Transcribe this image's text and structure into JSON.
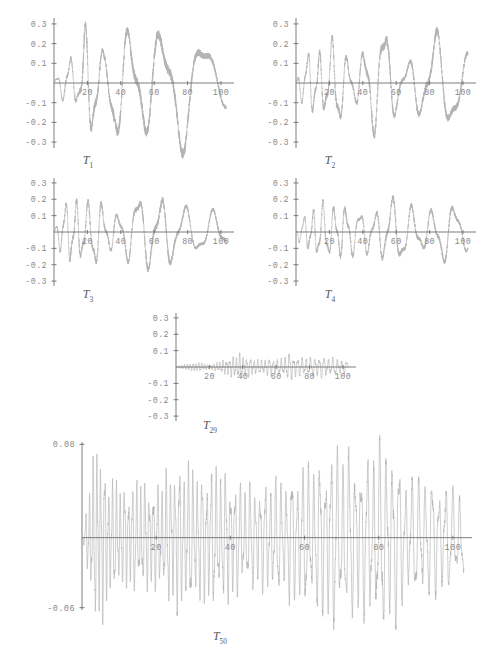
{
  "figure": {
    "background": "#ffffff",
    "curve_color": "#b3b3b3",
    "axis_color": "#6e6e6e",
    "label_color": "#8a8a8a"
  },
  "chart_data": [
    {
      "type": "line",
      "title": "T1",
      "label_base": "T",
      "label_sub": "1",
      "xlabel": "",
      "ylabel": "",
      "xlim": [
        0,
        103
      ],
      "ylim": [
        -0.33,
        0.33
      ],
      "xticks": [
        20,
        40,
        60,
        80,
        100
      ],
      "xtick_labels": [
        "20",
        "40",
        "60",
        "80",
        "100"
      ],
      "yticks": [
        0.3,
        0.2,
        0.1,
        -0.1,
        -0.2,
        -0.3
      ],
      "ytick_labels": [
        "0.3",
        "0.2",
        "0.1",
        "-0.1",
        "-0.2",
        "-0.3"
      ],
      "grid": false,
      "legend": "none",
      "description": "Slow amplitude-modulated oscillation; burst near t=20 reaching 0.33, smooth large lobes at t=50, 78",
      "envelope": [
        [
          0,
          0.02
        ],
        [
          10,
          0.13
        ],
        [
          14,
          0.1
        ],
        [
          18,
          0.34
        ],
        [
          24,
          0.3
        ],
        [
          30,
          0.12
        ],
        [
          36,
          0.28
        ],
        [
          44,
          0.28
        ],
        [
          52,
          0.3
        ],
        [
          62,
          0.31
        ],
        [
          70,
          0.3
        ],
        [
          78,
          0.32
        ],
        [
          88,
          0.22
        ],
        [
          96,
          0.15
        ],
        [
          103,
          0.12
        ]
      ],
      "carrier_period": [
        [
          0,
          7
        ],
        [
          20,
          10
        ],
        [
          40,
          16
        ],
        [
          60,
          22
        ],
        [
          80,
          26
        ],
        [
          103,
          28
        ]
      ],
      "phase": 0.2
    },
    {
      "type": "line",
      "title": "T2",
      "label_base": "T",
      "label_sub": "2",
      "xlim": [
        0,
        103
      ],
      "ylim": [
        -0.33,
        0.33
      ],
      "xticks": [
        20,
        40,
        60,
        80,
        100
      ],
      "xtick_labels": [
        "20",
        "40",
        "60",
        "80",
        "100"
      ],
      "yticks": [
        0.3,
        0.2,
        0.1,
        -0.1,
        -0.2,
        -0.3
      ],
      "ytick_labels": [
        "0.3",
        "0.2",
        "0.1",
        "-0.1",
        "-0.2",
        "-0.3"
      ],
      "grid": false,
      "legend": "none",
      "description": "Faster modulated oscillation, peak 0.24 near t=24 and t=84, deep trough -0.29 near t=54",
      "envelope": [
        [
          0,
          0.03
        ],
        [
          8,
          0.16
        ],
        [
          14,
          0.18
        ],
        [
          20,
          0.17
        ],
        [
          24,
          0.24
        ],
        [
          30,
          0.14
        ],
        [
          36,
          0.12
        ],
        [
          42,
          0.22
        ],
        [
          48,
          0.24
        ],
        [
          54,
          0.29
        ],
        [
          60,
          0.14
        ],
        [
          66,
          0.12
        ],
        [
          72,
          0.18
        ],
        [
          78,
          0.2
        ],
        [
          84,
          0.25
        ],
        [
          92,
          0.22
        ],
        [
          103,
          0.14
        ]
      ],
      "carrier_period": [
        [
          0,
          6
        ],
        [
          20,
          8
        ],
        [
          40,
          11
        ],
        [
          60,
          14
        ],
        [
          80,
          18
        ],
        [
          103,
          20
        ]
      ],
      "phase": 1.1
    },
    {
      "type": "line",
      "title": "T3",
      "label_base": "T",
      "label_sub": "3",
      "xlim": [
        0,
        103
      ],
      "ylim": [
        -0.33,
        0.33
      ],
      "xticks": [
        20,
        40,
        60,
        80,
        100
      ],
      "xtick_labels": [
        "20",
        "40",
        "60",
        "80",
        "100"
      ],
      "yticks": [
        0.3,
        0.2,
        0.1,
        -0.1,
        -0.2,
        -0.3
      ],
      "ytick_labels": [
        "0.3",
        "0.2",
        "0.1",
        "-0.1",
        "-0.2",
        "-0.3"
      ],
      "grid": false,
      "legend": "none",
      "description": "Dense early oscillations, growing lobes peaking 0.26 near t=66, decaying after t=80",
      "envelope": [
        [
          0,
          0.03
        ],
        [
          8,
          0.19
        ],
        [
          14,
          0.22
        ],
        [
          20,
          0.16
        ],
        [
          26,
          0.21
        ],
        [
          32,
          0.14
        ],
        [
          38,
          0.13
        ],
        [
          44,
          0.16
        ],
        [
          52,
          0.23
        ],
        [
          58,
          0.22
        ],
        [
          66,
          0.26
        ],
        [
          72,
          0.2
        ],
        [
          80,
          0.14
        ],
        [
          88,
          0.11
        ],
        [
          96,
          0.13
        ],
        [
          103,
          0.15
        ]
      ],
      "carrier_period": [
        [
          0,
          5.5
        ],
        [
          20,
          7.5
        ],
        [
          40,
          11
        ],
        [
          60,
          14
        ],
        [
          80,
          16
        ],
        [
          103,
          17
        ]
      ],
      "phase": 0.6
    },
    {
      "type": "line",
      "title": "T4",
      "label_base": "T",
      "label_sub": "4",
      "xlim": [
        0,
        103
      ],
      "ylim": [
        -0.33,
        0.33
      ],
      "xticks": [
        20,
        40,
        60,
        80,
        100
      ],
      "xtick_labels": [
        "20",
        "40",
        "60",
        "80",
        "100"
      ],
      "yticks": [
        0.3,
        0.2,
        0.1,
        -0.1,
        -0.2,
        -0.3
      ],
      "ytick_labels": [
        "0.3",
        "0.2",
        "0.1",
        "-0.1",
        "-0.2",
        "-0.3"
      ],
      "grid": false,
      "legend": "none",
      "description": "Irregular oscillation, peaks near 0.19 at t=28 and t=90, trough -0.22 near t=55",
      "envelope": [
        [
          0,
          0.03
        ],
        [
          8,
          0.13
        ],
        [
          14,
          0.18
        ],
        [
          20,
          0.14
        ],
        [
          26,
          0.19
        ],
        [
          30,
          0.18
        ],
        [
          36,
          0.11
        ],
        [
          42,
          0.13
        ],
        [
          48,
          0.15
        ],
        [
          55,
          0.22
        ],
        [
          62,
          0.17
        ],
        [
          70,
          0.15
        ],
        [
          78,
          0.14
        ],
        [
          84,
          0.16
        ],
        [
          90,
          0.19
        ],
        [
          96,
          0.14
        ],
        [
          103,
          0.1
        ]
      ],
      "carrier_period": [
        [
          0,
          5
        ],
        [
          20,
          6.5
        ],
        [
          40,
          9
        ],
        [
          60,
          11
        ],
        [
          80,
          13
        ],
        [
          103,
          14
        ]
      ],
      "phase": 2.2
    },
    {
      "type": "line",
      "title": "T29",
      "label_base": "T",
      "label_sub": "29",
      "xlim": [
        0,
        103
      ],
      "ylim": [
        -0.33,
        0.33
      ],
      "xticks": [
        20,
        40,
        60,
        80,
        100
      ],
      "xtick_labels": [
        "20",
        "40",
        "60",
        "80",
        "100"
      ],
      "yticks": [
        0.3,
        0.2,
        0.1,
        -0.1,
        -0.2,
        -0.3
      ],
      "ytick_labels": [
        "0.3",
        "0.2",
        "0.1",
        "-0.1",
        "-0.2",
        "-0.3"
      ],
      "grid": false,
      "legend": "none",
      "description": "High-frequency low-amplitude oscillation confined near zero, max about 0.08, nearly silent before t=22",
      "envelope": [
        [
          0,
          0.004
        ],
        [
          8,
          0.02
        ],
        [
          14,
          0.025
        ],
        [
          20,
          0.012
        ],
        [
          26,
          0.03
        ],
        [
          32,
          0.05
        ],
        [
          38,
          0.07
        ],
        [
          44,
          0.05
        ],
        [
          50,
          0.04
        ],
        [
          56,
          0.05
        ],
        [
          62,
          0.045
        ],
        [
          68,
          0.075
        ],
        [
          74,
          0.05
        ],
        [
          80,
          0.05
        ],
        [
          86,
          0.06
        ],
        [
          92,
          0.05
        ],
        [
          98,
          0.045
        ],
        [
          103,
          0.03
        ]
      ],
      "carrier_period": [
        [
          0,
          1.6
        ],
        [
          20,
          1.8
        ],
        [
          40,
          2.1
        ],
        [
          60,
          2.4
        ],
        [
          80,
          2.6
        ],
        [
          103,
          2.8
        ]
      ],
      "phase": 0.4
    },
    {
      "type": "line",
      "title": "T50",
      "label_base": "T",
      "label_sub": "50",
      "xlim": [
        0,
        103
      ],
      "ylim": [
        -0.062,
        0.082
      ],
      "xticks": [
        20,
        40,
        60,
        80,
        100
      ],
      "xtick_labels": [
        "20",
        "40",
        "60",
        "80",
        "100"
      ],
      "yticks": [
        0.08,
        -0.06
      ],
      "ytick_labels": [
        "0.08",
        "-0.06"
      ],
      "grid": false,
      "legend": "none",
      "description": "Very dense oscillation; large negative excursions to -0.06 around t=24-42, growing positive amplitude to 0.08 near t=70-84",
      "envelope": [
        [
          0,
          0.005
        ],
        [
          4,
          0.075
        ],
        [
          8,
          0.045
        ],
        [
          12,
          0.04
        ],
        [
          16,
          0.045
        ],
        [
          20,
          0.04
        ],
        [
          24,
          0.055
        ],
        [
          28,
          0.06
        ],
        [
          32,
          0.05
        ],
        [
          36,
          0.055
        ],
        [
          40,
          0.05
        ],
        [
          44,
          0.04
        ],
        [
          48,
          0.042
        ],
        [
          52,
          0.045
        ],
        [
          56,
          0.05
        ],
        [
          60,
          0.055
        ],
        [
          64,
          0.06
        ],
        [
          68,
          0.072
        ],
        [
          72,
          0.065
        ],
        [
          76,
          0.06
        ],
        [
          80,
          0.075
        ],
        [
          84,
          0.07
        ],
        [
          88,
          0.045
        ],
        [
          92,
          0.05
        ],
        [
          96,
          0.045
        ],
        [
          100,
          0.04
        ],
        [
          103,
          0.035
        ]
      ],
      "carrier_period": [
        [
          0,
          1.0
        ],
        [
          20,
          1.15
        ],
        [
          40,
          1.3
        ],
        [
          60,
          1.5
        ],
        [
          80,
          1.7
        ],
        [
          103,
          1.9
        ]
      ],
      "phase": 1.7
    }
  ]
}
